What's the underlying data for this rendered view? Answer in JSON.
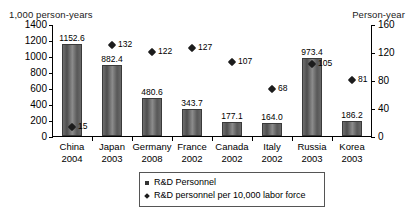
{
  "chart_data": {
    "type": "bar",
    "title": "",
    "subtitle": "",
    "xlabel": "",
    "ylabel": "1,000 person-years",
    "y2label": "Person-year",
    "grid": false,
    "legend_position": "bottom-center",
    "ylim": [
      0,
      1400
    ],
    "y2lim": [
      0,
      160
    ],
    "yticks": [
      0,
      200,
      400,
      600,
      800,
      1000,
      1200,
      1400
    ],
    "y2ticks": [
      0,
      40,
      80,
      120,
      160
    ],
    "categories": [
      "China",
      "Japan",
      "Germany",
      "France",
      "Canada",
      "Italy",
      "Russia",
      "Korea"
    ],
    "category_years": [
      "2004",
      "2003",
      "2008",
      "2002",
      "2002",
      "2002",
      "2003",
      "2003"
    ],
    "series": [
      {
        "name": "R&D Personnel",
        "type": "bar",
        "axis": "left",
        "unit": "1,000 person-years",
        "values": [
          1152.6,
          882.4,
          480.6,
          343.7,
          177.1,
          164.0,
          973.4,
          186.2
        ],
        "labels": [
          "1152.6",
          "882.4",
          "480.6",
          "343.7",
          "177.1",
          "164.0",
          "973.4",
          "186.2"
        ]
      },
      {
        "name": "R&D personnel per 10,000 labor force",
        "type": "scatter",
        "axis": "right",
        "unit": "Person-year",
        "values": [
          15,
          132,
          122,
          127,
          107,
          68,
          105,
          81
        ],
        "labels": [
          "15",
          "132",
          "122",
          "127",
          "107",
          "68",
          "105",
          "81"
        ]
      }
    ]
  },
  "legend": {
    "items": [
      {
        "label": "R&D Personnel",
        "marker": "square"
      },
      {
        "label": "R&D personnel per 10,000 labor force",
        "marker": "diamond"
      }
    ]
  },
  "colors": {
    "bar_fill": "#6f6f6f",
    "bar_edge": "#3a3a3a",
    "marker": "#1c1c1c",
    "axis": "#000000",
    "background": "#ffffff"
  }
}
